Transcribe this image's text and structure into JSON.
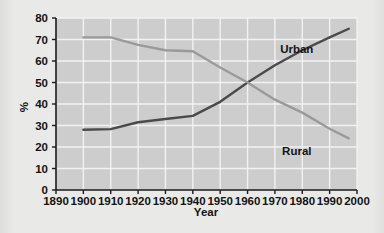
{
  "chart_data": {
    "type": "line",
    "title": "",
    "xlabel": "Year",
    "ylabel": "%",
    "xlim": [
      1890,
      2000
    ],
    "ylim": [
      0,
      80
    ],
    "xticks": [
      1890,
      1900,
      1910,
      1920,
      1930,
      1940,
      1950,
      1960,
      1970,
      1980,
      1990,
      2000
    ],
    "yticks": [
      0,
      10,
      20,
      30,
      40,
      50,
      60,
      70,
      80
    ],
    "grid": true,
    "legend_position": "inline-labels",
    "series": [
      {
        "name": "Urban",
        "color": "#4a4a4a",
        "x": [
          1900,
          1910,
          1920,
          1930,
          1940,
          1950,
          1960,
          1970,
          1980,
          1990,
          1997
        ],
        "values": [
          28,
          28.3,
          31.5,
          33,
          34.5,
          41,
          50,
          58,
          65,
          71,
          75
        ]
      },
      {
        "name": "Rural",
        "color": "#9a9a9a",
        "x": [
          1900,
          1910,
          1920,
          1930,
          1940,
          1950,
          1960,
          1970,
          1980,
          1990,
          1997
        ],
        "values": [
          71,
          71,
          67.5,
          65,
          64.5,
          57,
          50,
          42,
          36,
          28.5,
          24
        ]
      }
    ],
    "annotations": [
      {
        "text": "Urban",
        "x": 1978,
        "y": 63.5
      },
      {
        "text": "Rural",
        "x": 1978,
        "y": 16.5
      }
    ]
  },
  "axes": {
    "x_title": "Year",
    "y_title": "%",
    "x_tick_labels": [
      "1890",
      "1900",
      "1910",
      "1920",
      "1930",
      "1940",
      "1950",
      "1960",
      "1970",
      "1980",
      "1990",
      "2000"
    ],
    "y_tick_labels": [
      "0",
      "10",
      "20",
      "30",
      "40",
      "50",
      "60",
      "70",
      "80"
    ]
  },
  "labels": {
    "urban": "Urban",
    "rural": "Rural"
  },
  "colors": {
    "page_background": "#e9e9e7",
    "plot_background": "#cdcdcd",
    "gridline": "#f2f2f2",
    "axis": "#1a1a1a",
    "urban_line": "#4a4a4a",
    "rural_line": "#9a9a9a",
    "text": "#141414"
  }
}
